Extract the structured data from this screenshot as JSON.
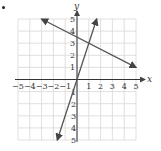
{
  "figure": {
    "bullet": "•",
    "x_axis_label": "x",
    "y_axis_label": "y",
    "x_ticks": [
      "−5",
      "−4",
      "−3",
      "−2",
      "−1",
      "1",
      "2",
      "3",
      "4",
      "5"
    ],
    "y_ticks_pos": [
      "1",
      "2",
      "3",
      "4",
      "5"
    ],
    "y_ticks_neg": [
      "1",
      "2",
      "3",
      "4",
      "5"
    ],
    "colors": {
      "grid": "#d8d8d8",
      "axis": "#333333",
      "line": "#555555"
    }
  },
  "chart_data": {
    "type": "line",
    "title": "",
    "xlabel": "x",
    "ylabel": "y",
    "xlim": [
      -5,
      5
    ],
    "ylim": [
      -5,
      5
    ],
    "grid": true,
    "series": [
      {
        "name": "y = 3x",
        "x": [
          -1.67,
          1.67
        ],
        "y": [
          -5,
          5
        ],
        "arrows_both_ends": true
      },
      {
        "name": "y = -0.5x + 3.5",
        "x": [
          -3,
          5
        ],
        "y": [
          5,
          1
        ],
        "arrows_both_ends": true
      }
    ],
    "intersection": {
      "x": 1,
      "y": 3
    }
  }
}
